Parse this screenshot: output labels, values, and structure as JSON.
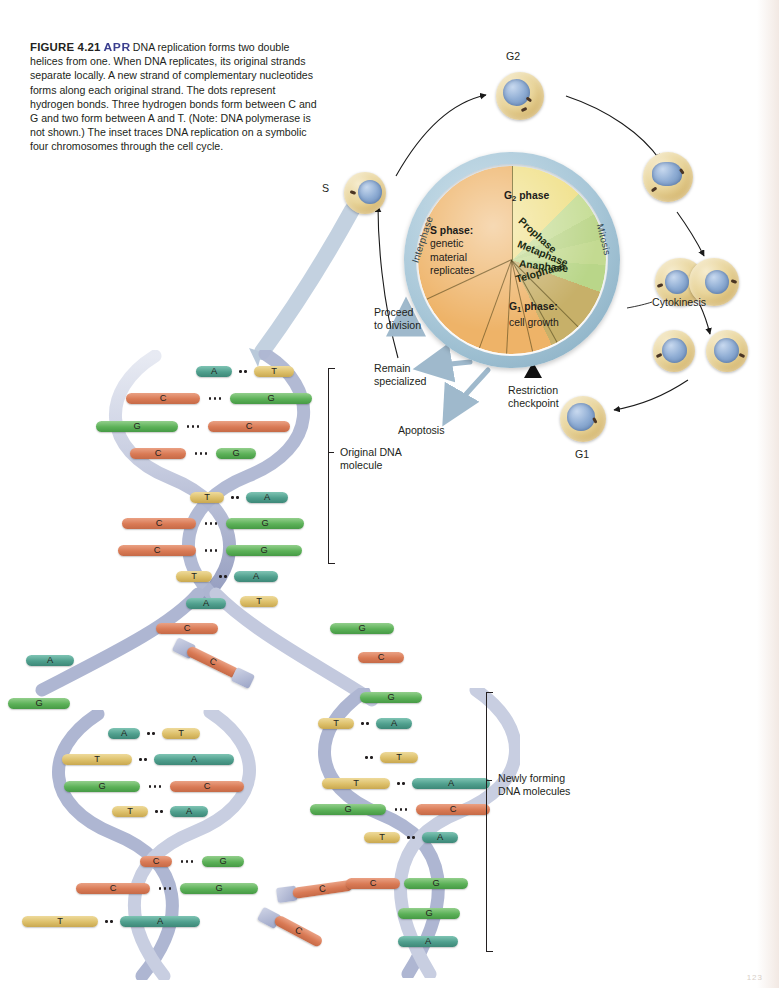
{
  "figure": {
    "number": "FIGURE 4.21",
    "apr_badge": "APR",
    "caption": "DNA replication forms two double helices from one. When DNA replicates, its original strands separate locally. A new strand of complementary nucleotides forms along each original strand. The dots represent hydrogen bonds. Three hydrogen bonds form between C and G and two form between A and T. (Note: DNA polymerase is not shown.) The inset traces DNA replication on a symbolic four chromosomes through the cell cycle."
  },
  "cell_cycle": {
    "segments": [
      {
        "name": "S phase",
        "label_bold": "S phase:",
        "label_rest": "genetic\nmaterial\nreplicates",
        "color": "#edb36a",
        "start_deg": 180,
        "end_deg": 295
      },
      {
        "name": "G2 phase",
        "label_bold": "G",
        "label_sub": "2",
        "label_rest": " phase",
        "color": "#c7b06a",
        "start_deg": 295,
        "end_deg": 340
      },
      {
        "name": "Prophase",
        "color": "#b9d68a",
        "start_deg": 340,
        "end_deg": 357
      },
      {
        "name": "Metaphase",
        "color": "#c3da92",
        "start_deg": 357,
        "end_deg": 13
      },
      {
        "name": "Anaphase",
        "color": "#bcd68c",
        "start_deg": 13,
        "end_deg": 29
      },
      {
        "name": "Telophase",
        "color": "#c6dd97",
        "start_deg": 29,
        "end_deg": 45
      },
      {
        "name": "G1 phase",
        "label_bold": "G",
        "label_sub": "1",
        "label_rest": " phase:",
        "label_rest2": "cell growth",
        "color": "#f0e08a",
        "start_deg": 45,
        "end_deg": 180
      }
    ],
    "mitosis_labels": [
      "Prophase",
      "Metaphase",
      "Anaphase",
      "Telophase"
    ],
    "arc_labels": {
      "interphase": "Interphase",
      "mitosis": "Mitosis"
    },
    "annotations": {
      "proceed": "Proceed\nto division",
      "remain": "Remain\nspecialized",
      "apoptosis": "Apoptosis",
      "restriction": "Restriction\ncheckpoint",
      "cytokinesis": "Cytokinesis"
    },
    "cell_labels": {
      "s": "S",
      "g2": "G2",
      "g1": "G1"
    }
  },
  "dna_labels": {
    "original": "Original DNA\nmolecule",
    "newly_forming": "Newly forming\nDNA molecules"
  },
  "dna": {
    "original_top": [
      {
        "left": "A",
        "right": "T",
        "bonds": 2
      },
      {
        "left": "C",
        "right": "G",
        "bonds": 3
      },
      {
        "left": "G",
        "right": "C",
        "bonds": 3
      },
      {
        "left": "C",
        "right": "G",
        "bonds": 3
      }
    ],
    "original_bottom": [
      {
        "left": "T",
        "right": "A",
        "bonds": 2
      },
      {
        "left": "C",
        "right": "G",
        "bonds": 3
      },
      {
        "left": "C",
        "right": "G",
        "bonds": 3
      },
      {
        "left": "T",
        "right": "A",
        "bonds": 2
      }
    ],
    "fork_unpaired": [
      "A",
      "T",
      "C",
      "G",
      "A",
      "C",
      "G",
      "C"
    ],
    "daughter_left": [
      {
        "left": "A",
        "right": "T",
        "bonds": 2
      },
      {
        "left": "T",
        "right": "A",
        "bonds": 2
      },
      {
        "left": "G",
        "right": "C",
        "bonds": 3
      },
      {
        "left": "T",
        "right": "A",
        "bonds": 2
      },
      {
        "left": "C",
        "right": "G",
        "bonds": 3
      },
      {
        "left": "C",
        "right": "G",
        "bonds": 3
      },
      {
        "left": "T",
        "right": "A",
        "bonds": 2
      }
    ],
    "daughter_right": [
      {
        "left": "T",
        "right": "A",
        "bonds": 2
      },
      {
        "left": "T",
        "right": "A",
        "bonds": 2
      },
      {
        "left": "T",
        "right": "A",
        "bonds": 2
      },
      {
        "left": "G",
        "right": "C",
        "bonds": 3
      },
      {
        "left": "T",
        "right": "A",
        "bonds": 2
      },
      {
        "left": "C",
        "right": "G",
        "bonds": 3
      },
      {
        "left": "G",
        "right": "",
        "bonds": 0
      },
      {
        "left": "A",
        "right": "",
        "bonds": 0
      }
    ],
    "free_nucleotides": [
      "C",
      "C",
      "C",
      "G"
    ],
    "base_colors": {
      "A": "#4f9f8d",
      "T": "#ddc06a",
      "C": "#d97a55",
      "G": "#5cb158"
    }
  },
  "page_number": "123"
}
